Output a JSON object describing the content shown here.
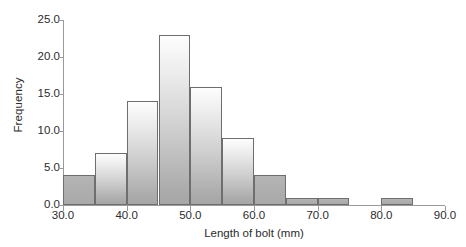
{
  "chart_data": {
    "type": "bar",
    "title": "",
    "subtitle": "",
    "xlabel": "Length of bolt (mm)",
    "ylabel": "Frequency",
    "xlim": [
      30.0,
      90.0
    ],
    "ylim": [
      0.0,
      25.0
    ],
    "grid": false,
    "legend": null,
    "bin_width": 5,
    "x_tick_labels": [
      "30.0",
      "40.0",
      "50.0",
      "60.0",
      "70.0",
      "80.0",
      "90.0"
    ],
    "x_tick_values": [
      30,
      40,
      50,
      60,
      70,
      80,
      90
    ],
    "y_tick_labels": [
      "0.0",
      "5.0",
      "10.0",
      "15.0",
      "20.0",
      "25.0"
    ],
    "y_tick_values": [
      0,
      5,
      10,
      15,
      20,
      25
    ],
    "categories": [
      "30-35",
      "35-40",
      "40-45",
      "45-50",
      "50-55",
      "55-60",
      "60-65",
      "65-70",
      "70-75",
      "75-80",
      "80-85",
      "85-90"
    ],
    "bin_edges": [
      30,
      35,
      40,
      45,
      50,
      55,
      60,
      65,
      70,
      75,
      80,
      85,
      90
    ],
    "values": [
      4,
      7,
      14,
      23,
      16,
      9,
      4,
      1,
      1,
      0,
      1,
      0
    ],
    "colors": {
      "bar_fill_top": "#fdfdfd",
      "bar_fill_bottom": "#a6a6a6",
      "bar_border": "#6e6e6e",
      "axis": "#9a9a9a",
      "text": "#2b2b2b",
      "background": "#ffffff"
    }
  }
}
